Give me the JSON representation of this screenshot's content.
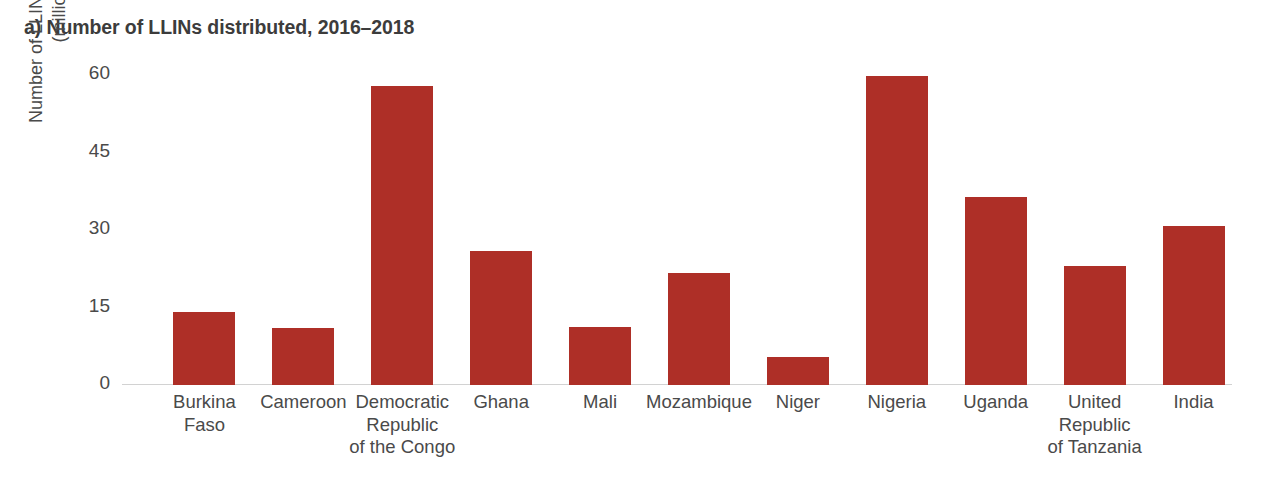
{
  "chart_data": {
    "type": "bar",
    "title": "a) Number of LLINs distributed, 2016–2018",
    "xlabel": "",
    "ylabel": "Number of LLINs distributed (million)",
    "ylabel_lines": [
      "Number of LLINs distributed",
      "(million)"
    ],
    "categories": [
      "Burkina Faso",
      "Cameroon",
      "Democratic Republic of the Congo",
      "Ghana",
      "Mali",
      "Mozambique",
      "Niger",
      "Nigeria",
      "Uganda",
      "United Republic of Tanzania",
      "India"
    ],
    "category_label_lines": [
      [
        "Burkina",
        "Faso"
      ],
      [
        "Cameroon"
      ],
      [
        "Democratic",
        "Republic",
        "of the Congo"
      ],
      [
        "Ghana"
      ],
      [
        "Mali"
      ],
      [
        "Mozambique"
      ],
      [
        "Niger"
      ],
      [
        "Nigeria"
      ],
      [
        "Uganda"
      ],
      [
        "United",
        "Republic",
        "of Tanzania"
      ],
      [
        "India"
      ]
    ],
    "values": [
      14.1,
      11.0,
      57.9,
      25.9,
      11.2,
      21.7,
      5.4,
      59.8,
      36.4,
      23.0,
      30.8
    ],
    "ylim": [
      0,
      60
    ],
    "yticks": [
      0,
      15,
      30,
      45,
      60
    ],
    "ytick_labels": [
      "0",
      "15",
      "30",
      "45",
      "60"
    ],
    "grid": false,
    "legend": "none",
    "bar_color": "#ae2f27",
    "axis_color": "#d2d2d2",
    "text_color": "#4a4a4a",
    "title_color": "#3c3c3c"
  }
}
